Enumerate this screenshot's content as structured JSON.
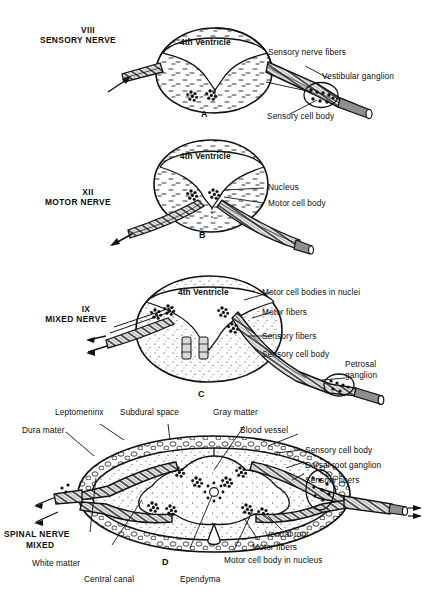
{
  "figure": {
    "ink_color": "#111111",
    "background_color": "#ffffff"
  },
  "panels": [
    {
      "id": "A",
      "letter": "A",
      "nerve_heading_line1": "VIII",
      "nerve_heading_line2": "SENSORY NERVE",
      "structure_label": "4th Ventricle",
      "callouts": [
        "Sensory nerve fibers",
        "Vestibular ganglion",
        "Sensory cell body"
      ]
    },
    {
      "id": "B",
      "letter": "B",
      "nerve_heading_line1": "XII",
      "nerve_heading_line2": "MOTOR NERVE",
      "structure_label": "4th Ventricle",
      "callouts": [
        "Nucleus",
        "Motor cell body"
      ]
    },
    {
      "id": "C",
      "letter": "C",
      "nerve_heading_line1": "IX",
      "nerve_heading_line2": "MIXED NERVE",
      "structure_label": "4th Ventricle",
      "callouts": [
        "Motor cell bodies in nuclei",
        "Motor fibers",
        "Sensory fibers",
        "Sensory cell body",
        "Petrosal",
        "ganglion"
      ]
    },
    {
      "id": "D",
      "letter": "D",
      "nerve_heading_line1": "SPINAL NERVE",
      "nerve_heading_line2": "MIXED",
      "callouts": [
        "Leptomeninx",
        "Subdural space",
        "Gray matter",
        "Dura mater",
        "Blood vessel",
        "Sensory cell body",
        "Dorsal root ganglion",
        "Sensory fibers",
        "Ventral root",
        "Motor fibers",
        "Motor cell body in nucleus",
        "White matter",
        "Central canal",
        "Ependyma"
      ]
    }
  ],
  "labels": {
    "a_heading_1": "VIII",
    "a_heading_2": "SENSORY NERVE",
    "a_ventricle": "4th Ventricle",
    "a_sensory_nerve_fibers": "Sensory nerve fibers",
    "a_vestibular_ganglion": "Vestibular ganglion",
    "a_sensory_cell_body": "Sensory cell body",
    "a_letter": "A",
    "b_heading_1": "XII",
    "b_heading_2": "MOTOR NERVE",
    "b_ventricle": "4th Ventricle",
    "b_nucleus": "Nucleus",
    "b_motor_cell_body": "Motor cell body",
    "b_letter": "B",
    "c_heading_1": "IX",
    "c_heading_2": "MIXED NERVE",
    "c_ventricle": "4th Ventricle",
    "c_motor_cell_bodies": "Motor cell bodies in nuclei",
    "c_motor_fibers": "Motor fibers",
    "c_sensory_fibers": "Sensory fibers",
    "c_sensory_cell_body": "Sensory cell body",
    "c_petrosal": "Petrosal",
    "c_ganglion": "ganglion",
    "c_letter": "C",
    "d_leptomeninx": "Leptomeninx",
    "d_subdural_space": "Subdural space",
    "d_gray_matter": "Gray matter",
    "d_dura_mater": "Dura mater",
    "d_blood_vessel": "Blood vessel",
    "d_sensory_cell_body": "Sensory cell body",
    "d_dorsal_root_ganglion": "Dorsal root ganglion",
    "d_sensory_fibers": "Sensory fibers",
    "d_ventral_root": "Ventral root",
    "d_motor_fibers": "Motor fibers",
    "d_motor_cell_body_nucleus": "Motor cell body in nucleus",
    "d_white_matter": "White matter",
    "d_central_canal": "Central canal",
    "d_ependyma": "Ependyma",
    "d_heading_1": "SPINAL NERVE",
    "d_heading_2": "MIXED",
    "d_letter": "D"
  }
}
